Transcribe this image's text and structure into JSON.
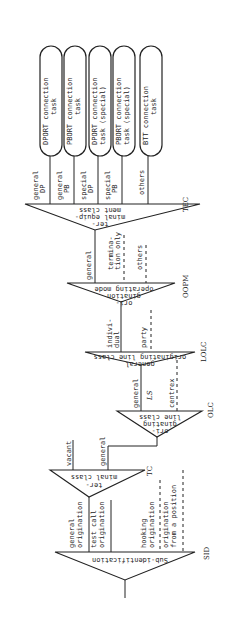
{
  "diagram": {
    "orientation": "rotated 90deg counter-clockwise",
    "nodes": {
      "sid": {
        "abbr": "SID",
        "label": "Sub-identification"
      },
      "tc": {
        "abbr": "TC",
        "label_1": "ter-",
        "label_2": "minal class"
      },
      "olc": {
        "abbr": "OLC",
        "label_1": "ori-",
        "label_2": "ginating",
        "label_3": "line class"
      },
      "lolc": {
        "abbr": "LOLC",
        "label_1": "general",
        "label_2": "originating line class"
      },
      "oopm": {
        "abbr": "OOPM",
        "label_1": "ori-",
        "label_2": "gination",
        "label_3": "operating mode"
      },
      "tec": {
        "abbr": "TEC",
        "label_1": "ter-",
        "label_2": "minal equip-",
        "label_3": "ment class"
      }
    },
    "branches": {
      "sid": [
        "general origination",
        "test call origination",
        "hooking origination",
        "origination from a position"
      ],
      "sid_lines": [
        [
          "general",
          "origination"
        ],
        [
          "test call",
          "origination"
        ],
        [
          "hooking",
          "origination"
        ],
        [
          "origination",
          "from a position"
        ]
      ],
      "tc": [
        "vacant",
        "general"
      ],
      "olc": [
        "general",
        "LS",
        "centrex"
      ],
      "lolc": [
        [
          "indivi-",
          "dual"
        ],
        [
          "party"
        ]
      ],
      "oopm": [
        [
          "general"
        ],
        [
          "termina-",
          "tion only"
        ],
        [
          "others"
        ]
      ],
      "tec": [
        [
          "general",
          "DP"
        ],
        [
          "general",
          "PB"
        ],
        [
          "special",
          "DP"
        ],
        [
          "special",
          "PB"
        ],
        [
          "others"
        ]
      ]
    },
    "tasks": [
      [
        "DPORT connection",
        "task"
      ],
      [
        "PBORT connection",
        "task"
      ],
      [
        "DPORT connection",
        "task (special)"
      ],
      [
        "PBORT connection",
        "task (special)"
      ],
      [
        "BTT connection",
        "task"
      ]
    ]
  }
}
